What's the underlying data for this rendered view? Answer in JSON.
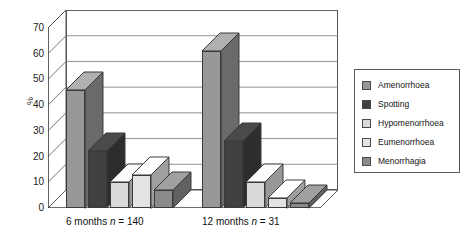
{
  "chart_data": {
    "type": "bar",
    "title": "",
    "subtitle": "",
    "xlabel": "",
    "ylabel": "%",
    "ylim": [
      0,
      70
    ],
    "ytick_labels": [
      "0",
      "10",
      "20",
      "30",
      "40",
      "50",
      "60",
      "70"
    ],
    "ytick_values": [
      0,
      10,
      20,
      30,
      40,
      50,
      60,
      70
    ],
    "grid": true,
    "grid_axis": "y",
    "legend_position": "right",
    "three_d": true,
    "categories": [
      "6 months n = 140",
      "12 months n = 31"
    ],
    "category_parts": [
      {
        "period": "6 months",
        "n_symbol": "n",
        "n_value": "140"
      },
      {
        "period": "12 months",
        "n_symbol": "n",
        "n_value": "31"
      }
    ],
    "series": [
      {
        "name": "Amenorrhoea",
        "color": "#989898",
        "values": [
          46,
          61
        ]
      },
      {
        "name": "Spotting",
        "color": "#404040",
        "values": [
          22,
          26
        ]
      },
      {
        "name": "Hypomenorrhoea",
        "color": "#d9d9d9",
        "values": [
          10,
          10
        ]
      },
      {
        "name": "Eumenorrhoea",
        "color": "#e3e3e3",
        "values": [
          13,
          4
        ]
      },
      {
        "name": "Menorrhagia",
        "color": "#8a8a8a",
        "values": [
          7,
          2
        ]
      }
    ]
  },
  "legend": {
    "items": [
      {
        "label": "Amenorrhoea",
        "color": "#989898"
      },
      {
        "label": "Spotting",
        "color": "#404040"
      },
      {
        "label": "Hypomenorrhoea",
        "color": "#d9d9d9"
      },
      {
        "label": "Eumenorrhoea",
        "color": "#e3e3e3"
      },
      {
        "label": "Menorrhagia",
        "color": "#8a8a8a"
      }
    ]
  },
  "edge_marginalia": [
    "",
    "",
    "",
    ""
  ]
}
